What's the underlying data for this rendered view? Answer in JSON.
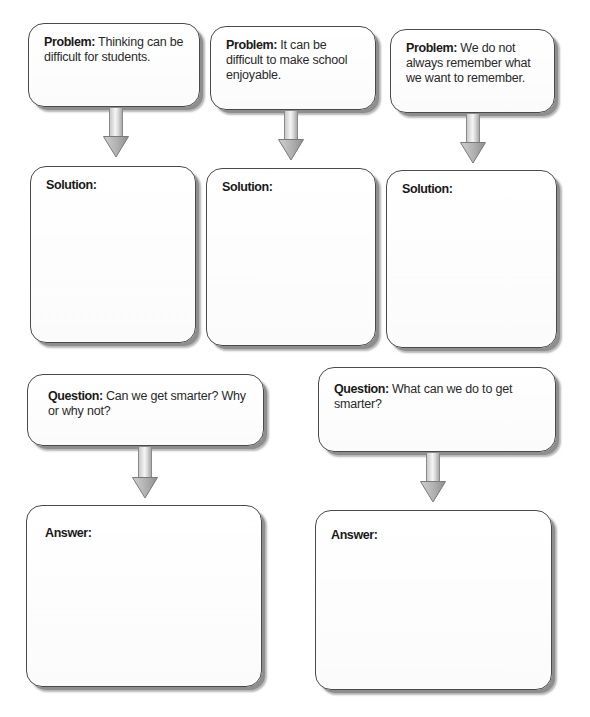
{
  "diagram": {
    "problems": [
      {
        "label": "Problem:",
        "text": " Thinking can be difficult for students."
      },
      {
        "label": "Problem:",
        "text": " It can be difficult to make school enjoyable."
      },
      {
        "label": "Problem:",
        "text": " We do not always remember what we want to remember."
      }
    ],
    "solutions": [
      {
        "label": "Solution:",
        "text": ""
      },
      {
        "label": "Solution:",
        "text": ""
      },
      {
        "label": "Solution:",
        "text": ""
      }
    ],
    "questions": [
      {
        "label": "Question:",
        "text": " Can we get smarter? Why or why not?"
      },
      {
        "label": "Question:",
        "text": " What can we do to get smarter?"
      }
    ],
    "answers": [
      {
        "label": "Answer:",
        "text": ""
      },
      {
        "label": "Answer:",
        "text": ""
      }
    ],
    "colors": {
      "box_border": "#4a4a4a",
      "box_shadow": "#8e8e8e",
      "arrow_fill": "#b8b8b8",
      "arrow_edge": "#8a8a8a"
    }
  }
}
